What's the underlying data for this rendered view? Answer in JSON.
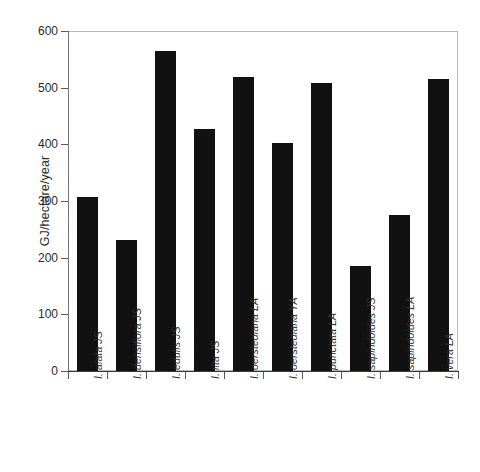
{
  "chart_data": {
    "type": "bar",
    "title": "",
    "subtitle": "",
    "xlabel": "",
    "ylabel": "GJ/hectare/year",
    "ylim": [
      0,
      600
    ],
    "yticks": [
      0,
      100,
      200,
      300,
      400,
      500,
      600
    ],
    "grid": false,
    "legend": null,
    "bar_color": "#111111",
    "orientation": "vertical",
    "categories": [
      "I. alata JS",
      "I. densiflora JS",
      "I. edulis JS",
      "I. ilta JS",
      "I. oerstediana LA",
      "I. oerstediana YA",
      "I. punctata LA",
      "I. sapindoides JS",
      "I. sapindoides LA",
      "I. vera LA"
    ],
    "values": [
      307,
      231,
      565,
      427,
      518,
      403,
      508,
      186,
      275,
      515
    ]
  },
  "axes": {
    "y_tick_labels": [
      "600",
      "500",
      "400",
      "300",
      "200",
      "100",
      "0"
    ],
    "y_axis_title": "GJ/hectare/year"
  }
}
